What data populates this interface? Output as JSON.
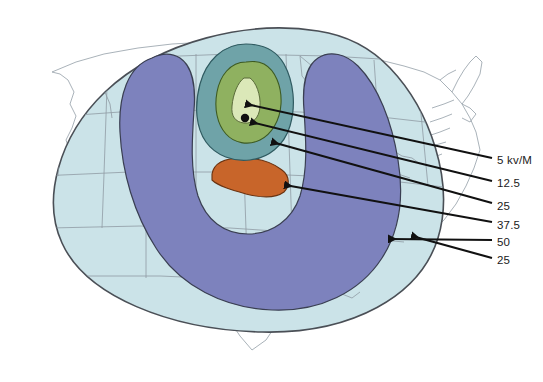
{
  "figure": {
    "kind": "contour-map",
    "basemap": "united-states-outline",
    "title_visible": false
  },
  "colors": {
    "background": "#ffffff",
    "land_inside_outer_contour": "#cbe3e8",
    "land_outside_contour": "#ffffff",
    "state_border": "#8f9aa3",
    "outer_contour_line": "#4a4f56",
    "band_50": "#7d82bd",
    "band_37_5": "#c8652a",
    "band_25_teal": "#6fa3a8",
    "band_12_5": "#8fb160",
    "peak_5kvm": "#dbe8b8",
    "marker_dot": "#101010",
    "leader_line": "#111111",
    "label_text": "#1a1a1a"
  },
  "chart_data": {
    "type": "contour-map",
    "title": "",
    "xlabel": "",
    "ylabel": "",
    "units": "kv/M",
    "legend_position": "right",
    "grid": false,
    "annotations": [
      {
        "label": "5 kv/M",
        "value": 5,
        "target": "peak-core"
      },
      {
        "label": "12.5",
        "value": 12.5,
        "target": "green-ring"
      },
      {
        "label": "25",
        "value": 25,
        "target": "teal-ring"
      },
      {
        "label": "37.5",
        "value": 37.5,
        "target": "orange-band"
      },
      {
        "label": "50",
        "value": 50,
        "target": "purple-horseshoe"
      },
      {
        "label": "25",
        "value": 25,
        "target": "outer-pale-circle"
      }
    ],
    "contour_levels": [
      5,
      12.5,
      25,
      37.5,
      50,
      25
    ]
  },
  "legend": {
    "items": [
      {
        "id": "lv1",
        "label": "5 kv/M",
        "x": 497,
        "y": 161
      },
      {
        "id": "lv2",
        "label": "12.5",
        "x": 497,
        "y": 184
      },
      {
        "id": "lv3",
        "label": "25",
        "x": 497,
        "y": 207
      },
      {
        "id": "lv4",
        "label": "37.5",
        "x": 497,
        "y": 226
      },
      {
        "id": "lv5",
        "label": "50",
        "x": 497,
        "y": 243
      },
      {
        "id": "lv6",
        "label": "25",
        "x": 497,
        "y": 261
      }
    ]
  },
  "leaders": [
    {
      "id": "ld1",
      "from_x": 492,
      "from_y": 158,
      "to_x": 246,
      "to_y": 104
    },
    {
      "id": "ld2",
      "from_x": 492,
      "from_y": 181,
      "to_x": 251,
      "to_y": 122
    },
    {
      "id": "ld3",
      "from_x": 492,
      "from_y": 203,
      "to_x": 272,
      "to_y": 142
    },
    {
      "id": "ld4",
      "from_x": 492,
      "from_y": 222,
      "to_x": 285,
      "to_y": 185
    },
    {
      "id": "ld5",
      "from_x": 492,
      "from_y": 240,
      "to_x": 389,
      "to_y": 239
    },
    {
      "id": "ld6",
      "from_x": 492,
      "from_y": 258,
      "to_x": 412,
      "to_y": 236
    }
  ],
  "markers": [
    {
      "id": "ground-zero",
      "x": 245,
      "y": 118,
      "r": 4
    }
  ]
}
